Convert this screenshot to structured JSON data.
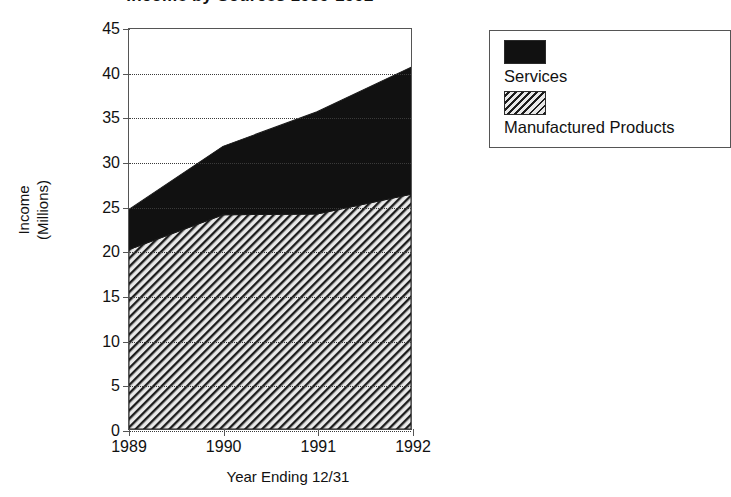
{
  "chart_data": {
    "type": "area",
    "title": "Income by Sources 1989-1992",
    "xlabel": "Year Ending 12/31",
    "ylabel": "Income\n(Millions)",
    "categories": [
      "1989",
      "1990",
      "1991",
      "1992"
    ],
    "x_tick_labels": [
      "1989",
      "1990",
      "1991",
      "1992"
    ],
    "y_tick_labels": [
      "0",
      "5",
      "10",
      "15",
      "20",
      "25",
      "30",
      "35",
      "40",
      "45"
    ],
    "y_tick_values": [
      0,
      5,
      10,
      15,
      20,
      25,
      30,
      35,
      40,
      45
    ],
    "ylim": [
      0,
      45
    ],
    "grid": true,
    "grid_style": "dotted-horizontal",
    "stacked": true,
    "legend_position": "right",
    "series": [
      {
        "name": "Manufactured Products",
        "fill": "diagonal-hatch",
        "color": "#d6d6d6",
        "values": [
          20.2,
          24.1,
          24.2,
          26.4
        ]
      },
      {
        "name": "Services",
        "fill": "solid",
        "color": "#111111",
        "values": [
          4.5,
          7.7,
          11.5,
          14.3
        ]
      }
    ],
    "stacked_totals": [
      24.7,
      31.8,
      35.7,
      40.7
    ],
    "annotations": []
  },
  "chart": {
    "title": "Income by Sources 1989-1992",
    "y_axis_title": "Income\n(Millions)",
    "x_axis_title": "Year Ending 12/31"
  },
  "legend": {
    "entries": [
      {
        "label": "Services",
        "swatch": "solid-black-swatch"
      },
      {
        "label": "Manufactured Products",
        "swatch": "diagonal-hatch-swatch"
      }
    ]
  },
  "colors": {
    "services": "#111111",
    "manufactured_products": "#d6d6d6",
    "axis": "#555555",
    "grid": "#3a3a3a",
    "background": "#ffffff"
  }
}
